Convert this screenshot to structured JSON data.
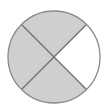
{
  "diagram": {
    "type": "fraction-circle",
    "total_parts": 4,
    "shaded_parts": 3,
    "fraction": "3/4",
    "center": [
      54,
      57
    ],
    "radius": 46,
    "segments": [
      {
        "position": "top",
        "shaded": true
      },
      {
        "position": "right",
        "shaded": false
      },
      {
        "position": "bottom",
        "shaded": true
      },
      {
        "position": "left",
        "shaded": true
      }
    ],
    "colors": {
      "shaded": "#cfcfcf",
      "unshaded": "#ffffff",
      "outline": "#8a8a8a",
      "divider": "#6e6e6e"
    }
  }
}
